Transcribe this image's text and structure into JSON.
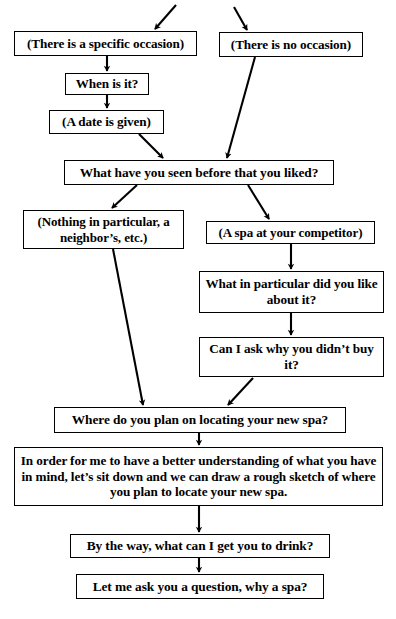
{
  "diagram": {
    "background_color": "#ffffff",
    "line_color": "#000000",
    "text_color": "#000000",
    "nodes": {
      "specific_occasion": "(There is a specific occasion)",
      "no_occasion": "(There is no occasion)",
      "when_is_it": "When is it?",
      "date_given": "(A date is given)",
      "seen_before": "What have you seen before that you liked?",
      "nothing_particular": "(Nothing in particular, a neighbor’s, etc.)",
      "spa_competitor": "(A spa at your competitor)",
      "what_particular": "What in particular did you like about it?",
      "why_not_buy": "Can I ask why you didn’t buy it?",
      "where_locate": "Where do you plan on locating your new spa?",
      "rough_sketch": "In order for me to have a better understanding of what you have in mind, let’s sit down and we can draw a rough sketch of where you plan to locate your new spa.",
      "drink": "By the way, what can I get you to drink?",
      "why_spa": "Let me ask you a question, why a spa?"
    },
    "edges": [
      {
        "name": "entry-arrow-to-specific-occasion",
        "from": "(off-chart above)",
        "to": "specific_occasion"
      },
      {
        "name": "entry-arrow-to-no-occasion",
        "from": "(off-chart above)",
        "to": "no_occasion"
      },
      {
        "name": "specific-occasion-to-when-is-it",
        "from": "specific_occasion",
        "to": "when_is_it"
      },
      {
        "name": "when-is-it-to-date-given",
        "from": "when_is_it",
        "to": "date_given"
      },
      {
        "name": "date-given-to-seen-before",
        "from": "date_given",
        "to": "seen_before"
      },
      {
        "name": "no-occasion-to-seen-before",
        "from": "no_occasion",
        "to": "seen_before"
      },
      {
        "name": "seen-before-to-nothing-particular",
        "from": "seen_before",
        "to": "nothing_particular"
      },
      {
        "name": "seen-before-to-spa-competitor",
        "from": "seen_before",
        "to": "spa_competitor"
      },
      {
        "name": "spa-competitor-to-what-particular",
        "from": "spa_competitor",
        "to": "what_particular"
      },
      {
        "name": "what-particular-to-why-not-buy",
        "from": "what_particular",
        "to": "why_not_buy"
      },
      {
        "name": "nothing-particular-to-where-locate",
        "from": "nothing_particular",
        "to": "where_locate"
      },
      {
        "name": "why-not-buy-to-where-locate",
        "from": "why_not_buy",
        "to": "where_locate"
      },
      {
        "name": "where-locate-to-rough-sketch",
        "from": "where_locate",
        "to": "rough_sketch"
      },
      {
        "name": "rough-sketch-to-drink",
        "from": "rough_sketch",
        "to": "drink"
      },
      {
        "name": "drink-to-why-spa",
        "from": "drink",
        "to": "why_spa"
      }
    ]
  }
}
